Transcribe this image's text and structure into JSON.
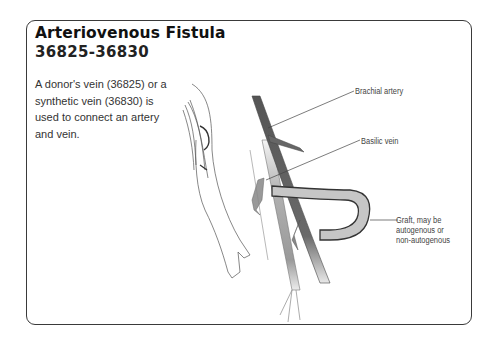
{
  "figure": {
    "title": "Arteriovenous Fistula",
    "code_range": "36825-36830",
    "description": "A donor's vein (36825) or a synthetic vein (36830) is used to connect an artery and vein.",
    "labels": {
      "brachial_artery": "Brachial artery",
      "basilic_vein": "Basilic vein",
      "graft_line1": "Graft, may be",
      "graft_line2": "autogenous or",
      "graft_line3": "non-autogenous"
    },
    "colors": {
      "artery": "#5a5a5a",
      "vein": "#b8b8b8",
      "graft": "#c4c4c4",
      "border": "#3a3a3a"
    }
  }
}
